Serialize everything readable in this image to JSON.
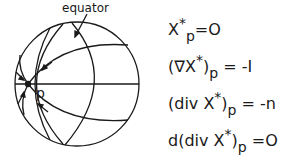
{
  "diagram": {
    "label_equator": "equator",
    "label_point": "p"
  },
  "equations": [
    {
      "lhs_main": "X",
      "lhs_sup": "*",
      "lhs_sub": "p",
      "rhs": "=O"
    },
    {
      "lhs_main": "(∇X",
      "lhs_sup": "*",
      "lhs_close": ")",
      "lhs_sub": "p",
      "rhs": " = -I"
    },
    {
      "lhs_main": "(div X",
      "lhs_sup": "*",
      "lhs_close": ")",
      "lhs_sub": "p",
      "rhs": " =  -n"
    },
    {
      "lhs_main": "d(div X",
      "lhs_sup": "*",
      "lhs_close": ")",
      "lhs_sub": "p",
      "rhs": " =O"
    }
  ]
}
